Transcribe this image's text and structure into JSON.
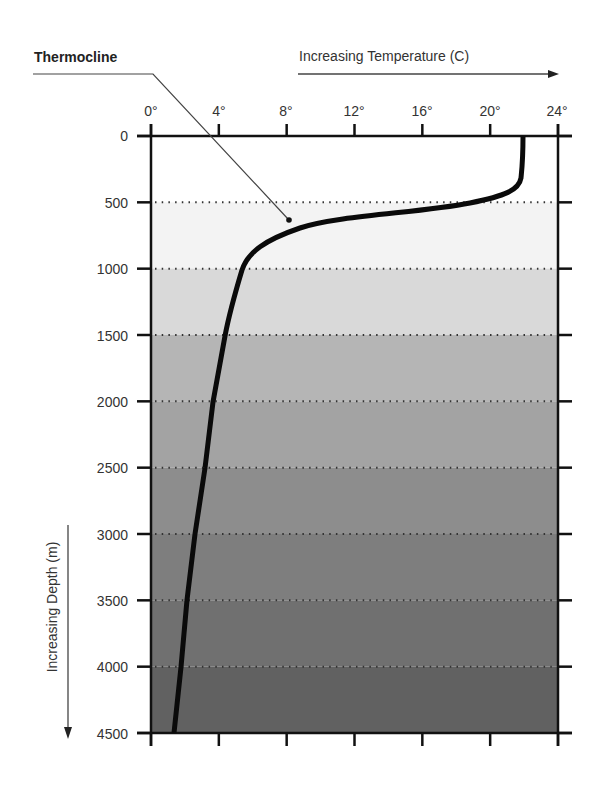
{
  "chart_data": {
    "type": "line",
    "title": "",
    "xlabel": "Increasing Temperature (C)",
    "ylabel": "Increasing Depth (m)",
    "xlim": [
      0,
      24
    ],
    "ylim": [
      4500,
      0
    ],
    "x_ticks": [
      0,
      4,
      8,
      12,
      16,
      20,
      24
    ],
    "x_tick_labels": [
      "0°",
      "4°",
      "8°",
      "12°",
      "16°",
      "20°",
      "24°"
    ],
    "y_ticks": [
      0,
      500,
      1000,
      1500,
      2000,
      2500,
      3000,
      3500,
      4000,
      4500
    ],
    "y_tick_labels": [
      "0",
      "500",
      "1000",
      "1500",
      "2000",
      "2500",
      "3000",
      "3500",
      "4000",
      "4500"
    ],
    "x_axis_position": "top",
    "y_axis_inverted": true,
    "grid": "horizontal dotted lines every 500 m",
    "background_bands": "grayscale shading darkening with depth per 500 m band",
    "series": [
      {
        "name": "Temperature profile",
        "points": [
          {
            "depth": 0,
            "temp": 22.0
          },
          {
            "depth": 200,
            "temp": 21.9
          },
          {
            "depth": 300,
            "temp": 21.6
          },
          {
            "depth": 390,
            "temp": 19.9
          },
          {
            "depth": 500,
            "temp": 15.3
          },
          {
            "depth": 590,
            "temp": 11.0
          },
          {
            "depth": 700,
            "temp": 8.2
          },
          {
            "depth": 800,
            "temp": 6.6
          },
          {
            "depth": 1000,
            "temp": 5.4
          },
          {
            "depth": 1500,
            "temp": 4.4
          },
          {
            "depth": 2000,
            "temp": 3.7
          },
          {
            "depth": 2500,
            "temp": 3.2
          },
          {
            "depth": 3000,
            "temp": 2.6
          },
          {
            "depth": 3500,
            "temp": 2.1
          },
          {
            "depth": 4000,
            "temp": 1.8
          },
          {
            "depth": 4500,
            "temp": 1.4
          }
        ]
      }
    ],
    "annotations": [
      {
        "text": "Thermocline",
        "points_to": {
          "depth": 640,
          "temp": 8.2
        }
      }
    ]
  },
  "labels": {
    "x_title": "Increasing Temperature (C)",
    "y_title": "Increasing Depth (m)",
    "thermocline": "Thermocline",
    "x_ticks": [
      "0°",
      "4°",
      "8°",
      "12°",
      "16°",
      "20°",
      "24°"
    ],
    "y_ticks": [
      "0",
      "500",
      "1000",
      "1500",
      "2000",
      "2500",
      "3000",
      "3500",
      "4000",
      "4500"
    ]
  },
  "colors": {
    "bands": [
      "#ffffff",
      "#f3f3f3",
      "#d9d9d9",
      "#b5b5b5",
      "#a3a3a3",
      "#8d8d8d",
      "#7e7e7e",
      "#707070",
      "#616161"
    ],
    "axis": "#111111",
    "curve": "#0a0a0a",
    "grid_dots": "#333333"
  }
}
